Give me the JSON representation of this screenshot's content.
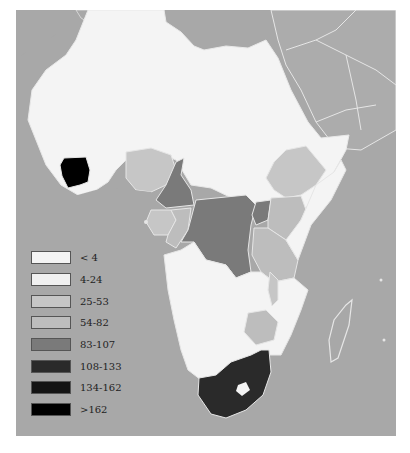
{
  "map": {
    "region": "Africa",
    "background_color": "#a8a8a8",
    "border_color": "#e6e6e6"
  },
  "legend": {
    "items": [
      {
        "label": "< 4",
        "color": "#f4f4f4"
      },
      {
        "label": "4-24",
        "color": "#f0f0f0"
      },
      {
        "label": "25-53",
        "color": "#c6c6c6"
      },
      {
        "label": "54-82",
        "color": "#bdbdbd"
      },
      {
        "label": "83-107",
        "color": "#7a7a7a"
      },
      {
        "label": "108-133",
        "color": "#2a2a2a"
      },
      {
        "label": "134-162",
        "color": "#141414"
      },
      {
        "label": ">162",
        "color": "#000000"
      }
    ]
  },
  "regions": [
    {
      "name": "North & Sahel Africa",
      "class": "< 4"
    },
    {
      "name": "Cote d'Ivoire",
      "class": ">162"
    },
    {
      "name": "Nigeria",
      "class": "25-53"
    },
    {
      "name": "Cameroon",
      "class": "83-107"
    },
    {
      "name": "Ethiopia",
      "class": "25-53"
    },
    {
      "name": "DR Congo",
      "class": "83-107"
    },
    {
      "name": "Uganda",
      "class": "83-107"
    },
    {
      "name": "Kenya",
      "class": "54-82"
    },
    {
      "name": "Tanzania",
      "class": "54-82"
    },
    {
      "name": "Gabon / Congo",
      "class": "25-53"
    },
    {
      "name": "Zimbabwe",
      "class": "54-82"
    },
    {
      "name": "South Africa",
      "class": "108-133"
    },
    {
      "name": "Madagascar",
      "class": "no data"
    }
  ]
}
